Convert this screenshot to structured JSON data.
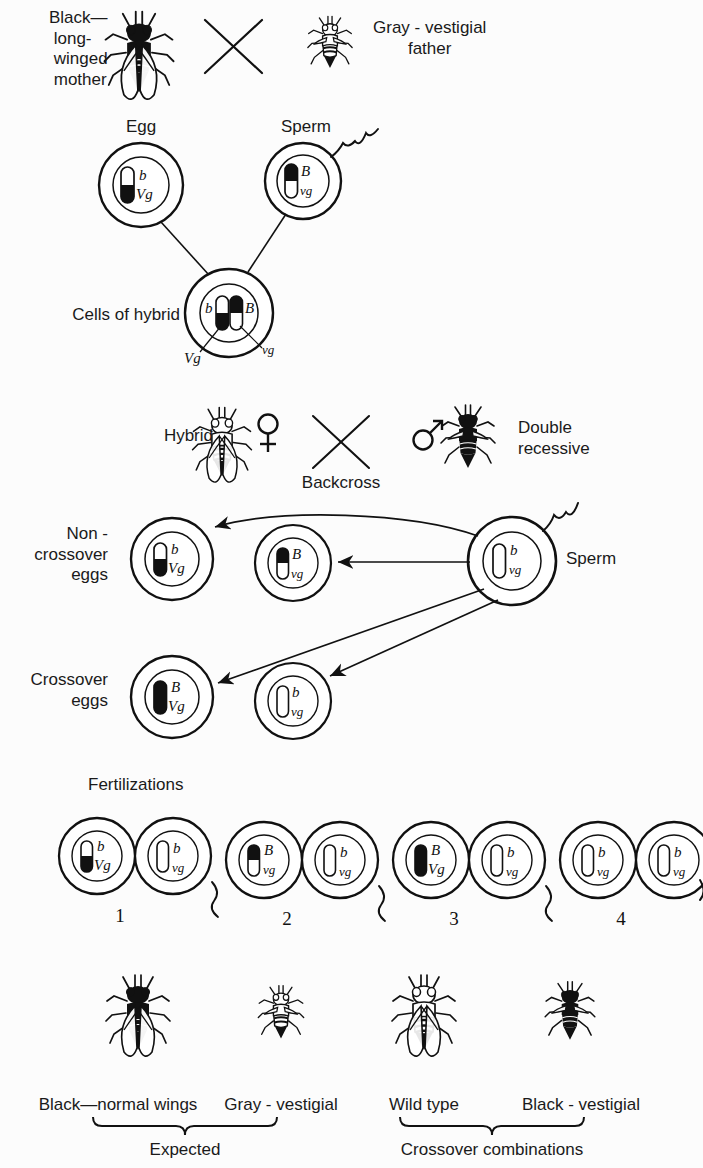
{
  "figure": {
    "title_implicit": "Crossing over in Drosophila: black long-winged mother x gray-vestigial father",
    "background": "#fcfcfc",
    "ink": "#111111"
  },
  "cross1": {
    "mother_label": "Black—\n long-\n winged\n mother",
    "father_label": "Gray - vestigial\nfather",
    "cross_symbol": "X",
    "mother_fly": {
      "body": "black",
      "wings": "long"
    },
    "father_fly": {
      "body": "gray",
      "wings": "vestigial"
    }
  },
  "gametes": {
    "egg_label": "Egg",
    "sperm_label": "Sperm",
    "egg": {
      "allele_top": "b",
      "allele_bottom": "Vg",
      "chrom_top": "white",
      "chrom_bottom": "black"
    },
    "sperm": {
      "allele_top": "B",
      "allele_bottom": "vg",
      "chrom_top": "black",
      "chrom_bottom": "white"
    }
  },
  "hybrid_cell": {
    "label": "Cells of hybrid",
    "left_chrom": {
      "allele_upper": "b",
      "allele_lower": "Vg",
      "top": "white",
      "bottom": "black"
    },
    "right_chrom": {
      "allele_upper": "B",
      "allele_lower": "vg",
      "top": "black",
      "bottom": "white"
    }
  },
  "backcross": {
    "hybrid_label": "Hybrid",
    "female_symbol": "♀",
    "male_symbol": "♂",
    "cross_symbol": "X",
    "backcross_label": "Backcross",
    "double_recessive_label": "Double\nrecessive",
    "hybrid_fly": {
      "body": "gray-banded",
      "wings": "long"
    },
    "recessive_fly": {
      "body": "black",
      "wings": "vestigial"
    }
  },
  "eggs": {
    "noncrossover_label": "Non -\ncrossover\neggs",
    "crossover_label": "Crossover\neggs",
    "sperm_label": "Sperm",
    "sperm_cell": {
      "allele_top": "b",
      "allele_bottom": "vg",
      "chrom": "white"
    },
    "noncrossover": [
      {
        "allele_top": "b",
        "allele_bottom": "Vg",
        "chrom_top": "white",
        "chrom_bottom": "black"
      },
      {
        "allele_top": "B",
        "allele_bottom": "vg",
        "chrom_top": "black",
        "chrom_bottom": "white"
      }
    ],
    "crossover": [
      {
        "allele_top": "B",
        "allele_bottom": "Vg",
        "chrom_top": "black",
        "chrom_bottom": "black"
      },
      {
        "allele_top": "b",
        "allele_bottom": "vg",
        "chrom_top": "white",
        "chrom_bottom": "white"
      }
    ]
  },
  "fertilizations": {
    "label": "Fertilizations",
    "items": [
      {
        "number": "1",
        "egg": {
          "allele_top": "b",
          "allele_bottom": "Vg",
          "chrom_top": "white",
          "chrom_bottom": "black"
        },
        "sperm": {
          "allele_top": "b",
          "allele_bottom": "vg",
          "chrom_top": "white",
          "chrom_bottom": "white"
        }
      },
      {
        "number": "2",
        "egg": {
          "allele_top": "B",
          "allele_bottom": "vg",
          "chrom_top": "black",
          "chrom_bottom": "white"
        },
        "sperm": {
          "allele_top": "b",
          "allele_bottom": "vg",
          "chrom_top": "white",
          "chrom_bottom": "white"
        }
      },
      {
        "number": "3",
        "egg": {
          "allele_top": "B",
          "allele_bottom": "Vg",
          "chrom_top": "black",
          "chrom_bottom": "black"
        },
        "sperm": {
          "allele_top": "b",
          "allele_bottom": "vg",
          "chrom_top": "white",
          "chrom_bottom": "white"
        }
      },
      {
        "number": "4",
        "egg": {
          "allele_top": "b",
          "allele_bottom": "vg",
          "chrom_top": "white",
          "chrom_bottom": "white"
        },
        "sperm": {
          "allele_top": "b",
          "allele_bottom": "vg",
          "chrom_top": "white",
          "chrom_bottom": "white"
        }
      }
    ]
  },
  "offspring": {
    "phenotypes": [
      {
        "label": "Black—normal wings",
        "body": "black",
        "wings": "long"
      },
      {
        "label": "Gray - vestigial",
        "body": "gray",
        "wings": "vestigial"
      },
      {
        "label": "Wild type",
        "body": "gray",
        "wings": "long"
      },
      {
        "label": "Black - vestigial",
        "body": "black",
        "wings": "vestigial"
      }
    ],
    "brace_left_label": "Expected",
    "brace_right_label": "Crossover combinations"
  }
}
